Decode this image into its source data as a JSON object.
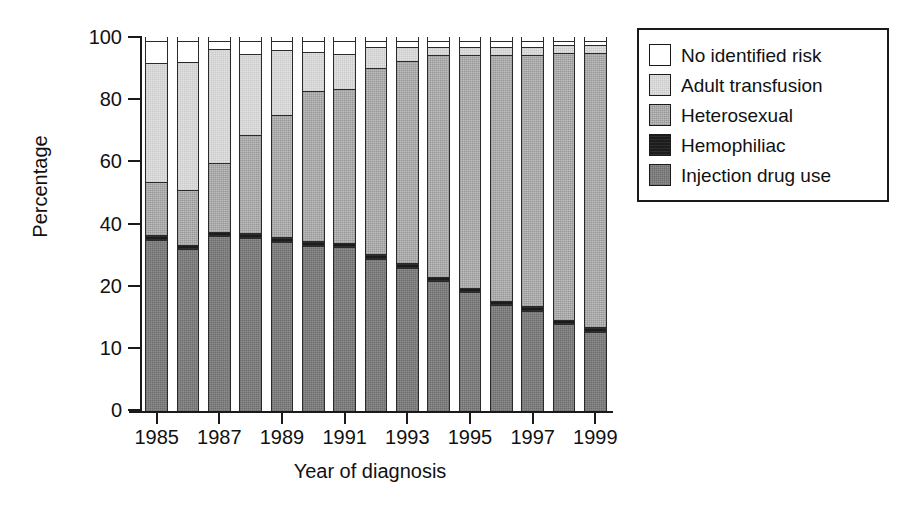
{
  "chart_data": {
    "type": "bar",
    "subtype": "stacked-bar-100",
    "title": "",
    "xlabel": "Year of diagnosis",
    "ylabel": "Percentage",
    "ylim": [
      0,
      100
    ],
    "ytick_labels": [
      "100",
      "80",
      "60",
      "40",
      "20",
      "10",
      "0"
    ],
    "xtick_labels": [
      "1985",
      "1987",
      "1989",
      "1991",
      "1993",
      "1995",
      "1997",
      "1999"
    ],
    "grid": false,
    "legend_position": "upper-right-outside",
    "categories": [
      "1985",
      "1986",
      "1987",
      "1988",
      "1989",
      "1990",
      "1991",
      "1992",
      "1993",
      "1994",
      "1995",
      "1996",
      "1997",
      "1998",
      "1999"
    ],
    "series": [
      {
        "name": "Injection drug use",
        "color": "#8e8e8e",
        "values": [
          46,
          43.5,
          47,
          46.5,
          45.5,
          44.5,
          44,
          41,
          38.5,
          35,
          32,
          28.5,
          27,
          23.5,
          21.5
        ]
      },
      {
        "name": "Hemophiliac",
        "color": "#1c1c1c",
        "values": [
          1.5,
          1.5,
          1.5,
          1.5,
          1.5,
          1.5,
          1.5,
          1.5,
          1.5,
          1.5,
          1.5,
          1.5,
          1.5,
          1.5,
          1.5
        ]
      },
      {
        "name": "Heterosexual",
        "color": "#bdbdbd",
        "values": [
          14.5,
          15,
          18.5,
          26.5,
          33,
          40.5,
          41.5,
          50,
          54.5,
          59.5,
          62.5,
          66,
          67.5,
          71.5,
          73.5
        ]
      },
      {
        "name": "Adult transfusion",
        "color": "#e2e2e2",
        "values": [
          32,
          34.5,
          31,
          22,
          17.5,
          10.5,
          9.5,
          6,
          4,
          2.5,
          2.5,
          2.5,
          2.5,
          2.5,
          2.5
        ]
      },
      {
        "name": "No identified risk",
        "color": "#ffffff",
        "values": [
          6,
          5.5,
          2,
          3.5,
          2.5,
          3,
          3.5,
          1.5,
          1.5,
          1.5,
          1.5,
          1.5,
          1.5,
          1,
          1
        ]
      }
    ]
  },
  "legend": {
    "items": [
      {
        "label": "No identified risk",
        "swatch": "fill-nir"
      },
      {
        "label": "Adult transfusion",
        "swatch": "fill-adt"
      },
      {
        "label": "Heterosexual",
        "swatch": "fill-het"
      },
      {
        "label": "Hemophiliac",
        "swatch": "fill-hem"
      },
      {
        "label": "Injection drug use",
        "swatch": "fill-idu"
      }
    ]
  },
  "axes": {
    "y_title": "Percentage",
    "x_title": "Year of diagnosis"
  },
  "geometry": {
    "plot_left": 141,
    "plot_right": 611,
    "plot_top": 37,
    "plot_bottom": 411,
    "bar_count": 15,
    "y_tick_pixels": [
      37,
      99,
      161,
      224,
      286,
      348,
      410
    ]
  }
}
